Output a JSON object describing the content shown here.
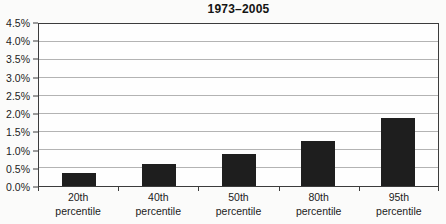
{
  "chart_data": {
    "type": "bar",
    "title": "1973–2005",
    "categories": [
      "20th percentile",
      "40th percentile",
      "50th percentile",
      "80th percentile",
      "95th percentile"
    ],
    "values": [
      0.35,
      0.6,
      0.9,
      1.25,
      1.9
    ],
    "value_unit": "%",
    "xlabel": "",
    "ylabel": "",
    "ylim": [
      0,
      4.5
    ],
    "ytick_step": 0.5,
    "ytick_labels_top_to_bottom": [
      "4.5%",
      "4.0%",
      "3.5%",
      "3.0%",
      "2.5%",
      "2.0%",
      "1.5%",
      "1.0%",
      "0.5%",
      "0.0%"
    ],
    "grid": true,
    "legend": "none",
    "bar_color": "#1e1e1e",
    "axis_color": "#3c3c3c",
    "gridline_color": "#b3b3b3",
    "text_color": "#1c1c1c"
  }
}
